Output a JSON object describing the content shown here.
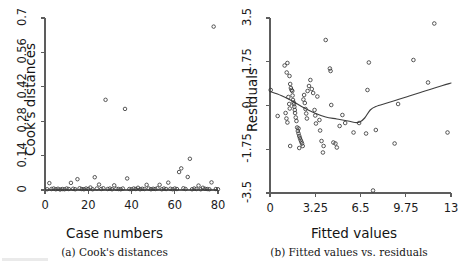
{
  "figure": {
    "background_color": "#ffffff",
    "axis_color": "#5d5d5d",
    "point_color": "#3a3a3a",
    "curve_color": "#3f3f3f"
  },
  "chart_data": [
    {
      "type": "scatter",
      "panel_id": "a",
      "title": "",
      "caption": "(a) Cook's distances",
      "xlabel": "Case numbers",
      "ylabel": "Cook's distances",
      "xlim": [
        0,
        80
      ],
      "ylim": [
        0,
        0.7
      ],
      "grid": false,
      "legend": "none",
      "xticks": [
        0,
        20,
        40,
        60,
        80
      ],
      "xtick_labels": [
        "0",
        "20",
        "40",
        "60",
        "80"
      ],
      "yticks": [
        0,
        0.14,
        0.28,
        0.42,
        0.56,
        0.7
      ],
      "ytick_labels": [
        "0",
        "0.14",
        "0.28",
        "0.42",
        "0.56",
        "0.7"
      ],
      "marker": "open-circle",
      "n_points": 80,
      "x": [
        1,
        2,
        3,
        4,
        5,
        6,
        7,
        8,
        9,
        10,
        11,
        12,
        13,
        14,
        15,
        16,
        17,
        18,
        19,
        20,
        21,
        22,
        23,
        24,
        25,
        26,
        27,
        28,
        29,
        30,
        31,
        32,
        33,
        34,
        35,
        36,
        37,
        38,
        39,
        40,
        41,
        42,
        43,
        44,
        45,
        46,
        47,
        48,
        49,
        50,
        51,
        52,
        53,
        54,
        55,
        56,
        57,
        58,
        59,
        60,
        61,
        62,
        63,
        64,
        65,
        66,
        67,
        68,
        69,
        70,
        71,
        72,
        73,
        74,
        75,
        76,
        77,
        78,
        79,
        80
      ],
      "y": [
        0.003,
        0.028,
        0.004,
        0.006,
        0.003,
        0.005,
        0.002,
        0.004,
        0.003,
        0.006,
        0.004,
        0.029,
        0.005,
        0.003,
        0.044,
        0.007,
        0.004,
        0.003,
        0.006,
        0.004,
        0.01,
        0.003,
        0.052,
        0.006,
        0.022,
        0.004,
        0.007,
        0.367,
        0.004,
        0.006,
        0.003,
        0.019,
        0.005,
        0.004,
        0.003,
        0.006,
        0.33,
        0.047,
        0.004,
        0.003,
        0.006,
        0.004,
        0.009,
        0.003,
        0.005,
        0.004,
        0.021,
        0.006,
        0.003,
        0.005,
        0.004,
        0.007,
        0.021,
        0.003,
        0.006,
        0.004,
        0.03,
        0.005,
        0.003,
        0.006,
        0.004,
        0.073,
        0.088,
        0.007,
        0.004,
        0.053,
        0.127,
        0.003,
        0.006,
        0.004,
        0.018,
        0.003,
        0.009,
        0.005,
        0.004,
        0.003,
        0.031,
        0.665,
        0.004,
        0.003
      ],
      "annotations": [
        {
          "label": "largest Cook's distance",
          "x": 78,
          "y": 0.665
        },
        {
          "label": "second outlier",
          "x": 28,
          "y": 0.367
        },
        {
          "label": "third outlier",
          "x": 37,
          "y": 0.33
        }
      ]
    },
    {
      "type": "scatter",
      "panel_id": "b",
      "title": "",
      "caption": "(b) Fitted values vs. residuals",
      "xlabel": "Fitted values",
      "ylabel": "Residuals",
      "xlim": [
        0,
        13
      ],
      "ylim": [
        -3.5,
        3.5
      ],
      "grid": false,
      "legend": "none",
      "xticks": [
        0,
        3.25,
        6.5,
        9.75,
        13
      ],
      "xtick_labels": [
        "0",
        "3.25",
        "6.5",
        "9.75",
        "13"
      ],
      "yticks": [
        -3.5,
        -1.75,
        0,
        1.75,
        3.5
      ],
      "ytick_labels": [
        "-3.5",
        "-1.75",
        "0",
        "1.75",
        "3.5"
      ],
      "marker": "open-circle",
      "n_points": 80,
      "points": [
        [
          0.05,
          0.62
        ],
        [
          0.55,
          -0.42
        ],
        [
          1.05,
          1.6
        ],
        [
          1.2,
          1.32
        ],
        [
          1.25,
          1.7
        ],
        [
          1.4,
          1.18
        ],
        [
          1.45,
          0.86
        ],
        [
          1.5,
          0.7
        ],
        [
          1.55,
          0.62
        ],
        [
          1.6,
          0.58
        ],
        [
          1.62,
          0.4
        ],
        [
          1.65,
          0.22
        ],
        [
          1.7,
          0.12
        ],
        [
          1.72,
          0.05
        ],
        [
          1.75,
          -0.05
        ],
        [
          1.78,
          -0.18
        ],
        [
          1.8,
          -0.3
        ],
        [
          1.85,
          -0.48
        ],
        [
          1.9,
          -0.62
        ],
        [
          1.95,
          -0.88
        ],
        [
          2.0,
          -1.02
        ],
        [
          2.05,
          -1.12
        ],
        [
          2.1,
          -1.22
        ],
        [
          2.15,
          -1.3
        ],
        [
          2.2,
          -1.38
        ],
        [
          2.25,
          -1.45
        ],
        [
          2.3,
          -1.52
        ],
        [
          2.1,
          -1.7
        ],
        [
          2.35,
          -1.62
        ],
        [
          1.45,
          -1.62
        ],
        [
          1.12,
          -0.3
        ],
        [
          1.18,
          -0.52
        ],
        [
          1.25,
          -0.68
        ],
        [
          1.32,
          0.34
        ],
        [
          1.38,
          0.06
        ],
        [
          1.42,
          -0.12
        ],
        [
          2.4,
          0.24
        ],
        [
          2.45,
          0.42
        ],
        [
          2.5,
          0.1
        ],
        [
          2.55,
          -0.14
        ],
        [
          2.6,
          -0.32
        ],
        [
          2.65,
          -0.52
        ],
        [
          2.7,
          0.58
        ],
        [
          2.8,
          0.78
        ],
        [
          2.9,
          1.02
        ],
        [
          3.0,
          0.66
        ],
        [
          3.1,
          0.5
        ],
        [
          3.2,
          -0.18
        ],
        [
          3.25,
          -0.4
        ],
        [
          3.3,
          -0.72
        ],
        [
          3.4,
          0.36
        ],
        [
          3.55,
          -0.58
        ],
        [
          3.6,
          -1.0
        ],
        [
          3.7,
          -1.42
        ],
        [
          3.8,
          -1.88
        ],
        [
          3.85,
          -1.62
        ],
        [
          4.0,
          2.62
        ],
        [
          4.3,
          1.48
        ],
        [
          4.35,
          1.38
        ],
        [
          4.4,
          0.02
        ],
        [
          4.55,
          -1.48
        ],
        [
          4.7,
          -1.52
        ],
        [
          4.8,
          -1.68
        ],
        [
          5.0,
          -0.82
        ],
        [
          5.2,
          -0.38
        ],
        [
          5.4,
          -0.7
        ],
        [
          6.0,
          -1.08
        ],
        [
          6.4,
          -0.7
        ],
        [
          6.9,
          -1.12
        ],
        [
          7.0,
          0.62
        ],
        [
          7.1,
          1.72
        ],
        [
          7.4,
          -3.4
        ],
        [
          7.6,
          -0.98
        ],
        [
          8.95,
          -1.52
        ],
        [
          9.2,
          0.06
        ],
        [
          10.3,
          1.82
        ],
        [
          11.35,
          0.92
        ],
        [
          11.8,
          3.28
        ],
        [
          12.75,
          -1.08
        ],
        [
          2.05,
          -0.92
        ]
      ],
      "lowess_curve": [
        [
          0.0,
          0.56
        ],
        [
          0.8,
          0.4
        ],
        [
          1.6,
          0.18
        ],
        [
          2.4,
          -0.08
        ],
        [
          3.2,
          -0.3
        ],
        [
          4.0,
          -0.46
        ],
        [
          4.8,
          -0.54
        ],
        [
          5.6,
          -0.62
        ],
        [
          6.1,
          -0.68
        ],
        [
          6.45,
          -0.66
        ],
        [
          6.8,
          -0.5
        ],
        [
          7.2,
          -0.18
        ],
        [
          7.6,
          -0.04
        ],
        [
          8.4,
          0.1
        ],
        [
          9.2,
          0.24
        ],
        [
          10.0,
          0.38
        ],
        [
          10.8,
          0.52
        ],
        [
          11.6,
          0.66
        ],
        [
          12.4,
          0.8
        ],
        [
          13.0,
          0.9
        ]
      ],
      "annotations": [
        {
          "label": "lowess smoother",
          "x": 6.45,
          "y": -0.66
        }
      ]
    }
  ]
}
